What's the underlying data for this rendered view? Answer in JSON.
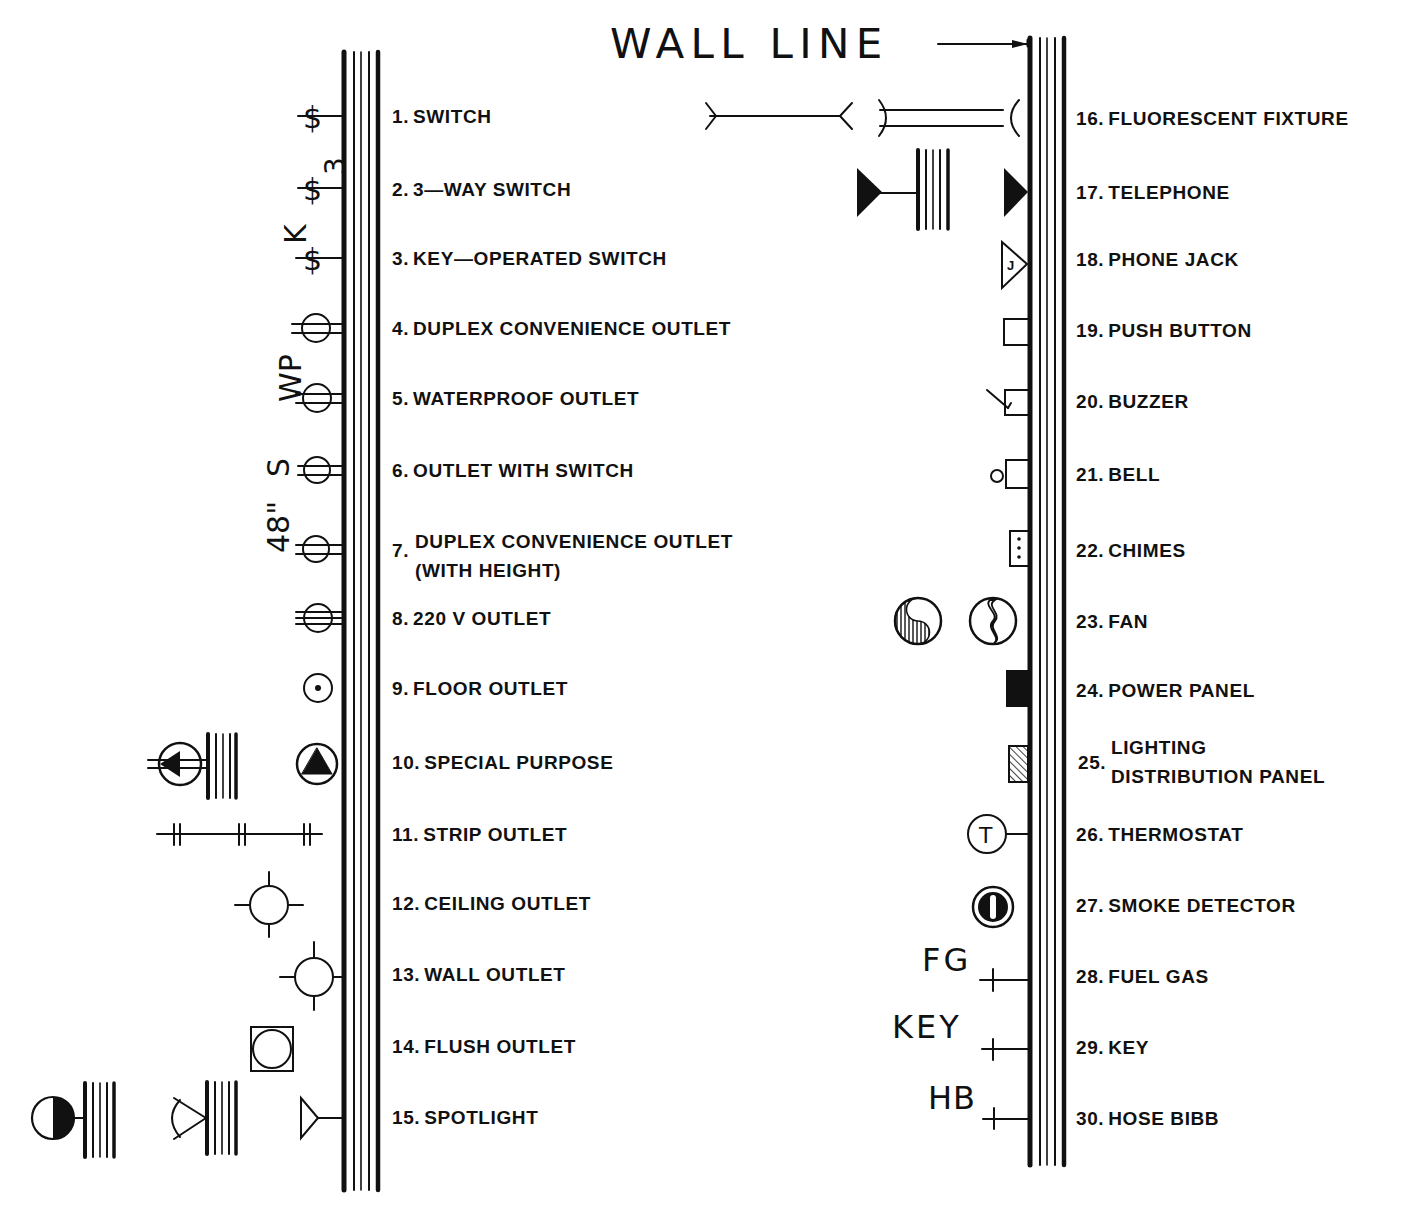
{
  "title": "WALL LINE",
  "colors": {
    "ink": "#111111",
    "paper": "#ffffff"
  },
  "annotations": {
    "k": "K",
    "three": "3",
    "wp": "WP",
    "s": "S",
    "height": "48\"",
    "fg": "FG",
    "key": "KEY",
    "hb": "HB",
    "thermostat_letter": "T",
    "phone_jack_letter": "J"
  },
  "left_items": [
    {
      "num": "1.",
      "label": "SWITCH",
      "icon": "switch-icon"
    },
    {
      "num": "2.",
      "label": "3—WAY SWITCH",
      "icon": "three-way-switch-icon"
    },
    {
      "num": "3.",
      "label": "KEY—OPERATED SWITCH",
      "icon": "key-operated-switch-icon"
    },
    {
      "num": "4.",
      "label": "DUPLEX CONVENIENCE OUTLET",
      "icon": "duplex-outlet-icon"
    },
    {
      "num": "5.",
      "label": "WATERPROOF OUTLET",
      "icon": "waterproof-outlet-icon"
    },
    {
      "num": "6.",
      "label": "OUTLET WITH SWITCH",
      "icon": "outlet-with-switch-icon"
    },
    {
      "num": "7.",
      "label": "DUPLEX CONVENIENCE OUTLET",
      "label2": "(WITH HEIGHT)",
      "icon": "duplex-outlet-height-icon"
    },
    {
      "num": "8.",
      "label": "220 V OUTLET",
      "icon": "outlet-220v-icon"
    },
    {
      "num": "9.",
      "label": "FLOOR OUTLET",
      "icon": "floor-outlet-icon"
    },
    {
      "num": "10.",
      "label": "SPECIAL PURPOSE",
      "icon": "special-purpose-icon"
    },
    {
      "num": "11.",
      "label": "STRIP OUTLET",
      "icon": "strip-outlet-icon"
    },
    {
      "num": "12.",
      "label": "CEILING OUTLET",
      "icon": "ceiling-outlet-icon"
    },
    {
      "num": "13.",
      "label": "WALL OUTLET",
      "icon": "wall-outlet-icon"
    },
    {
      "num": "14.",
      "label": "FLUSH OUTLET",
      "icon": "flush-outlet-icon"
    },
    {
      "num": "15.",
      "label": "SPOTLIGHT",
      "icon": "spotlight-icon"
    }
  ],
  "right_items": [
    {
      "num": "16.",
      "label": "FLUORESCENT FIXTURE",
      "icon": "fluorescent-fixture-icon"
    },
    {
      "num": "17.",
      "label": "TELEPHONE",
      "icon": "telephone-icon"
    },
    {
      "num": "18.",
      "label": "PHONE JACK",
      "icon": "phone-jack-icon"
    },
    {
      "num": "19.",
      "label": "PUSH BUTTON",
      "icon": "push-button-icon"
    },
    {
      "num": "20.",
      "label": "BUZZER",
      "icon": "buzzer-icon"
    },
    {
      "num": "21.",
      "label": "BELL",
      "icon": "bell-icon"
    },
    {
      "num": "22.",
      "label": "CHIMES",
      "icon": "chimes-icon"
    },
    {
      "num": "23.",
      "label": "FAN",
      "icon": "fan-icon"
    },
    {
      "num": "24.",
      "label": "POWER PANEL",
      "icon": "power-panel-icon"
    },
    {
      "num": "25.",
      "label": "LIGHTING",
      "label2": "DISTRIBUTION PANEL",
      "icon": "lighting-panel-icon"
    },
    {
      "num": "26.",
      "label": "THERMOSTAT",
      "icon": "thermostat-icon"
    },
    {
      "num": "27.",
      "label": "SMOKE DETECTOR",
      "icon": "smoke-detector-icon"
    },
    {
      "num": "28.",
      "label": "FUEL GAS",
      "icon": "fuel-gas-icon"
    },
    {
      "num": "29.",
      "label": "KEY",
      "icon": "key-icon"
    },
    {
      "num": "30.",
      "label": "HOSE BIBB",
      "icon": "hose-bibb-icon"
    }
  ]
}
